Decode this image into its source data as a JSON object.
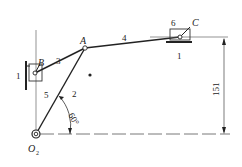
{
  "diagram": {
    "type": "mechanism-kinematic-sketch",
    "points": {
      "A": "A",
      "B": "B",
      "C": "C",
      "O2": "O",
      "O2_sub": "2"
    },
    "links": {
      "frame_left": "1",
      "frame_right": "1",
      "crank": "2",
      "link_3": "3",
      "link_4": "4",
      "slider_5": "5",
      "slider_6": "6"
    },
    "angle_label": "60°",
    "dimension_label": "151",
    "colors": {
      "line": "#222222",
      "thin": "#555555",
      "background": "#ffffff"
    }
  }
}
